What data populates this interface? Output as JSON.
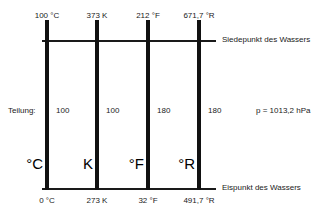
{
  "diagram": {
    "background_color": "#ffffff",
    "ink_color": "#111111",
    "row_label": "Teilung:",
    "pressure_note": "p = 1013,2 hPa",
    "top_line_caption": "Siedepunkt des Wassers",
    "bottom_line_caption": "Eispunkt des Wassers",
    "scales": [
      {
        "unit": "°C",
        "top_value": "100 °C",
        "bottom_value": "0 °C",
        "divisions": "100"
      },
      {
        "unit": "K",
        "top_value": "373 K",
        "bottom_value": "273 K",
        "divisions": "100"
      },
      {
        "unit": "°F",
        "top_value": "212 °F",
        "bottom_value": "32 °F",
        "divisions": "180"
      },
      {
        "unit": "°R",
        "top_value": "671,7 °R",
        "bottom_value": "491,7 °R",
        "divisions": "180"
      }
    ]
  }
}
